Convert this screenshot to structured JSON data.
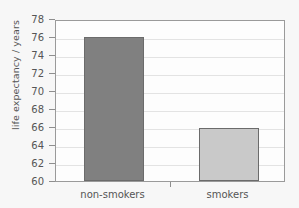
{
  "chart_data": {
    "type": "bar",
    "title": "",
    "xlabel": "",
    "ylabel": "life expectancy / years",
    "categories": [
      "non-smokers",
      "smokers"
    ],
    "values": [
      76.0,
      65.9
    ],
    "ylim": [
      60,
      78
    ],
    "yticks": [
      60,
      62,
      64,
      66,
      68,
      70,
      72,
      74,
      76,
      78
    ],
    "ytick_labels": [
      "60",
      "62",
      "64",
      "66",
      "68",
      "70",
      "72",
      "74",
      "76",
      "78"
    ],
    "grid": true,
    "legend": "none",
    "bar_colors": [
      "#808080",
      "#c9c9c9"
    ],
    "bar_edge_color": "#6b6b6b"
  },
  "figure": {
    "background_color": "#f7f7f7",
    "plot_background_color": "#fdfdfd",
    "frame_color": "#9a9a9a",
    "gridline_color": "#e3e3e3",
    "text_color": "#555555"
  }
}
